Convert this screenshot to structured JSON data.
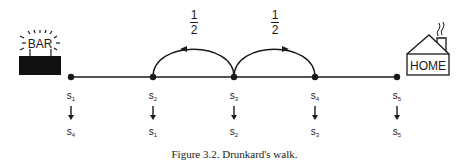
{
  "figure": {
    "caption": "Figure 3.2. Drunkard's walk.",
    "left_end_label": "BAR",
    "right_end_label": "HOME",
    "transition_probabilities": [
      {
        "from": "s3",
        "to": "s2",
        "label_num": "1",
        "label_den": "2"
      },
      {
        "from": "s3",
        "to": "s4",
        "label_num": "1",
        "label_den": "2"
      }
    ],
    "states": [
      {
        "name": "s",
        "sub": "1",
        "maps_to_sub": "4"
      },
      {
        "name": "s",
        "sub": "2",
        "maps_to_sub": "1"
      },
      {
        "name": "s",
        "sub": "3",
        "maps_to_sub": "2"
      },
      {
        "name": "s",
        "sub": "4",
        "maps_to_sub": "3"
      },
      {
        "name": "s",
        "sub": "5",
        "maps_to_sub": "5"
      }
    ],
    "colors": {
      "ink": "#1a1a1a",
      "background": "#ffffff"
    }
  }
}
